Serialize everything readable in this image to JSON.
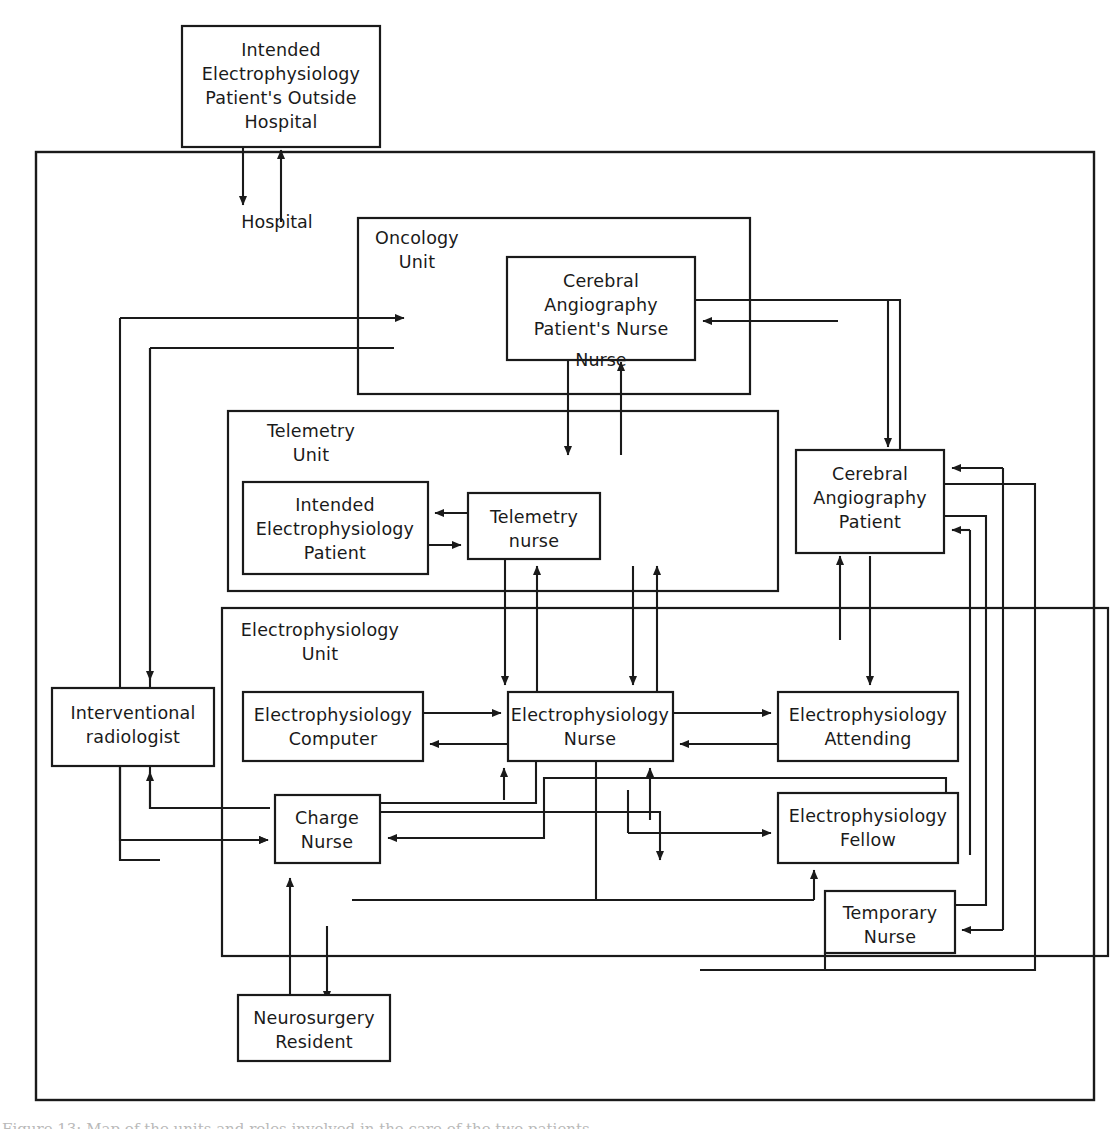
{
  "figure": {
    "caption": "Figure 13: Map of the units and roles involved in the care of the two patients."
  },
  "labels": {
    "hospital_boundary": "Hospital"
  },
  "groups": [
    {
      "id": "oncology",
      "name": "Oncology Unit",
      "line1": "Oncology",
      "line2": "Unit",
      "x": 358,
      "y": 218,
      "w": 392,
      "h": 176
    },
    {
      "id": "telemetry",
      "name": "Telemetry Unit",
      "line1": "Telemetry",
      "line2": "Unit",
      "x": 228,
      "y": 411,
      "w": 550,
      "h": 180
    },
    {
      "id": "electrophysiology",
      "name": "Electrophysiology Unit",
      "line1": "Electrophysiology",
      "line2": "Unit",
      "x": 222,
      "y": 608,
      "w": 886,
      "h": 348
    }
  ],
  "nodes": [
    {
      "id": "outside-hospital",
      "lines": [
        "Intended",
        "Electrophysiology",
        "Patient's Outside",
        "Hospital"
      ],
      "x": 182,
      "y": 26,
      "w": 198,
      "h": 121
    },
    {
      "id": "ca-patient-nurse",
      "lines": [
        "Cerebral",
        "Angiography",
        "Patient's Nurse"
      ],
      "overflow": "Nurse",
      "x": 507,
      "y": 257,
      "w": 188,
      "h": 103
    },
    {
      "id": "intended-ep-patient",
      "lines": [
        "Intended",
        "Electrophysiology",
        "Patient"
      ],
      "x": 243,
      "y": 482,
      "w": 185,
      "h": 92
    },
    {
      "id": "telemetry-nurse",
      "lines": [
        "Telemetry",
        "nurse"
      ],
      "x": 468,
      "y": 493,
      "w": 132,
      "h": 66
    },
    {
      "id": "ca-patient",
      "lines": [
        "Cerebral",
        "Angiography",
        "Patient"
      ],
      "x": 796,
      "y": 450,
      "w": 148,
      "h": 103
    },
    {
      "id": "interventional-radiologist",
      "lines": [
        "Interventional",
        "radiologist"
      ],
      "x": 52,
      "y": 688,
      "w": 162,
      "h": 78
    },
    {
      "id": "ep-computer",
      "lines": [
        "Electrophysiology",
        "Computer"
      ],
      "x": 243,
      "y": 692,
      "w": 180,
      "h": 69
    },
    {
      "id": "ep-nurse",
      "lines": [
        "Electrophysiology",
        "Nurse"
      ],
      "x": 508,
      "y": 692,
      "w": 165,
      "h": 69
    },
    {
      "id": "ep-attending",
      "lines": [
        "Electrophysiology",
        "Attending"
      ],
      "x": 778,
      "y": 692,
      "w": 180,
      "h": 69
    },
    {
      "id": "charge-nurse",
      "lines": [
        "Charge",
        "Nurse"
      ],
      "x": 275,
      "y": 795,
      "w": 105,
      "h": 68
    },
    {
      "id": "ep-fellow",
      "lines": [
        "Electrophysiology",
        "Fellow"
      ],
      "x": 778,
      "y": 793,
      "w": 180,
      "h": 70
    },
    {
      "id": "temporary-nurse",
      "lines": [
        "Temporary",
        "Nurse"
      ],
      "x": 825,
      "y": 891,
      "w": 130,
      "h": 62
    },
    {
      "id": "neurosurgery-resident",
      "lines": [
        "Neurosurgery",
        "Resident"
      ],
      "x": 238,
      "y": 995,
      "w": 152,
      "h": 66
    }
  ],
  "outer_frame": {
    "x": 36,
    "y": 152,
    "w": 1058,
    "h": 948
  },
  "colors": {
    "stroke": "#1a1a1a",
    "fill": "#ffffff",
    "background": "#ffffff"
  }
}
